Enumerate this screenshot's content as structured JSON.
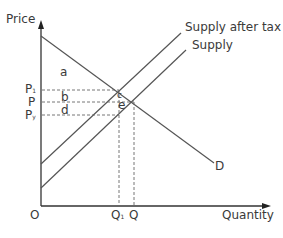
{
  "diagram": {
    "axes": {
      "y_label": "Price",
      "x_label": "Quantity",
      "origin": "O"
    },
    "curves": {
      "supply_after_tax": "Supply after tax",
      "supply": "Supply",
      "demand": "D"
    },
    "price_labels": {
      "p1": "P",
      "p1_sub": "1",
      "p": "P",
      "py": "P",
      "py_sub": "y"
    },
    "quantity_labels": {
      "q1": "Q",
      "q1_sub": "1",
      "q": "Q"
    },
    "areas": {
      "a": "a",
      "b": "b",
      "c": "c",
      "d": "d",
      "e": "e"
    },
    "colors": {
      "line": "#555555",
      "text": "#3a3a3a",
      "axis": "#333333"
    }
  }
}
